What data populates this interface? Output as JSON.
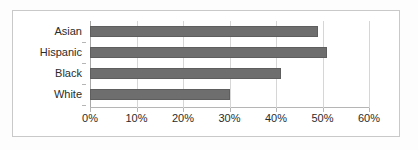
{
  "chart_data": {
    "type": "bar",
    "orientation": "horizontal",
    "title": "",
    "subtitle": "",
    "xlabel": "",
    "ylabel": "",
    "categories": [
      "Asian",
      "Hispanic",
      "Black",
      "White"
    ],
    "values": [
      49,
      51,
      41,
      30
    ],
    "value_suffix": "%",
    "xlim": [
      0,
      60
    ],
    "xticks": [
      0,
      10,
      20,
      30,
      40,
      50,
      60
    ],
    "xtick_labels": [
      "0%",
      "10%",
      "20%",
      "30%",
      "40%",
      "50%",
      "60%"
    ],
    "grid": true,
    "grid_axis": "x",
    "legend": false,
    "legend_position": "none",
    "series": [
      {
        "name": "",
        "color": "#6e6e6e",
        "values": [
          49,
          51,
          41,
          30
        ]
      }
    ],
    "annotations": [
      {
        "text": "",
        "position": "top-left",
        "style": "faint-watermark"
      },
      {
        "text": "",
        "position": "top-right",
        "style": "faint-watermark"
      }
    ]
  },
  "colors": {
    "bar": "#6e6e6e",
    "bar_border": "#5e5e5e",
    "gridline": "#d6d6d6",
    "axis": "#a8a8a8",
    "frame": "#c9c9c9",
    "text": "#2b2b2b",
    "background": "#ffffff",
    "watermark": "#f0f0f0"
  }
}
